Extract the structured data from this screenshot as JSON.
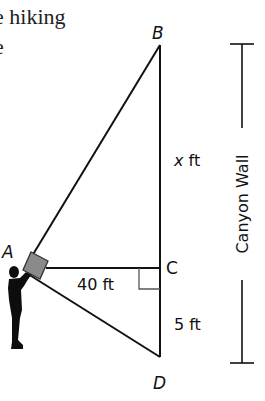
{
  "intro_text": {
    "line1": "e hiking",
    "line2": "e"
  },
  "diagram": {
    "points": {
      "A": "A",
      "B": "B",
      "C": "C",
      "D": "D"
    },
    "measurements": {
      "BC": "x ft",
      "AC": "40 ft",
      "CD": "5 ft"
    },
    "wall_label": "Canyon Wall",
    "colors": {
      "line": "#111111",
      "right_angle": "#555555",
      "camera_fill": "#8a8a8a",
      "hiker": "#0d0d0d"
    }
  }
}
